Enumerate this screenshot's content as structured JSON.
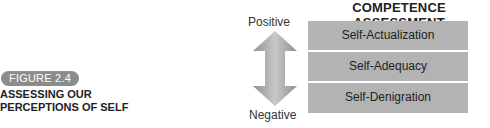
{
  "figure": {
    "badge": "FIGURE 2.4",
    "caption_line1": "ASSESSING OUR",
    "caption_line2": "PERCEPTIONS OF SELF"
  },
  "diagram": {
    "title": "COMPETENCE ASSESSMENT",
    "axis": {
      "top_label": "Positive",
      "bottom_label": "Negative",
      "arrow_icon": "double-headed-vertical-arrow"
    },
    "levels": [
      {
        "label": "Self-Actualization"
      },
      {
        "label": "Self-Adequacy"
      },
      {
        "label": "Self-Denigration"
      }
    ],
    "colors": {
      "box_fill": "#b3b3b3",
      "badge_fill": "#8c8c8c",
      "arrow_fill": "#999999"
    }
  }
}
